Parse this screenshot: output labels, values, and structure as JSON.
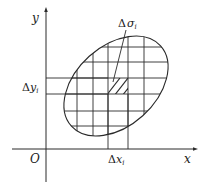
{
  "diagram": {
    "colors": {
      "stroke": "#2a2a2a",
      "text": "#1a1a1a",
      "background": "#ffffff"
    },
    "axes": {
      "x_label": "x",
      "y_label": "y",
      "origin_label": "O"
    },
    "labels": {
      "delta_sigma": {
        "symbol": "Δ",
        "var": "σ",
        "sub": "i"
      },
      "delta_x": {
        "symbol": "Δ",
        "var": "x",
        "sub": "i"
      },
      "delta_y": {
        "symbol": "Δ",
        "var": "y",
        "sub": "i"
      }
    },
    "region": {
      "shape": "tilted ellipse",
      "center": [
        116,
        86
      ],
      "rx": 60,
      "ry": 40,
      "rotation_deg": -42
    },
    "grid": {
      "vertical_lines_x": [
        77,
        93,
        108,
        128,
        144
      ],
      "horizontal_lines_y": [
        47,
        62,
        78,
        94,
        111,
        126
      ],
      "highlighted_cell": {
        "x0": 108,
        "x1": 128,
        "y0": 78,
        "y1": 94,
        "fill": "hatched"
      }
    }
  }
}
